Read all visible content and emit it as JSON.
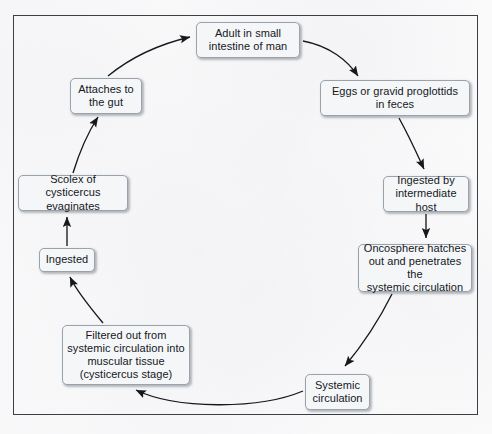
{
  "diagram": {
    "frame_border_color": "#3c3f45",
    "background_color": "#fbfbfc",
    "node_fill_color": "#f4f6f8",
    "node_border_color": "#9aa2ac",
    "arrow_color": "#16181c",
    "nodes": [
      {
        "id": "adult",
        "label": "Adult in small\nintestine of man",
        "x": 196,
        "y": 22,
        "w": 104,
        "h": 36
      },
      {
        "id": "eggs",
        "label": "Eggs or gravid proglottids\nin feces",
        "x": 320,
        "y": 80,
        "w": 150,
        "h": 36
      },
      {
        "id": "ingested_ih",
        "label": "Ingested by\nintermediate host",
        "x": 383,
        "y": 176,
        "w": 86,
        "h": 36
      },
      {
        "id": "oncosphere",
        "label": "Oncosphere hatches\nout and penetrates the\nsystemic circulation",
        "x": 358,
        "y": 244,
        "w": 114,
        "h": 48
      },
      {
        "id": "systemic",
        "label": "Systemic\ncirculation",
        "x": 305,
        "y": 374,
        "w": 65,
        "h": 36
      },
      {
        "id": "filtered",
        "label": "Filtered out from\nsystemic circulation into\nmuscular tissue\n(cysticercus stage)",
        "x": 62,
        "y": 325,
        "w": 128,
        "h": 60
      },
      {
        "id": "ingested",
        "label": "Ingested",
        "x": 39,
        "y": 248,
        "w": 56,
        "h": 24
      },
      {
        "id": "scolex",
        "label": "Scolex of cysticercus\nevaginates",
        "x": 18,
        "y": 175,
        "w": 110,
        "h": 36
      },
      {
        "id": "attaches",
        "label": "Attaches to\nthe gut",
        "x": 70,
        "y": 78,
        "w": 72,
        "h": 36
      }
    ],
    "edges": [
      {
        "from": "adult",
        "to": "eggs",
        "name": "adult-to-eggs-arrow"
      },
      {
        "from": "eggs",
        "to": "ingested_ih",
        "name": "eggs-to-ingested-host-arrow"
      },
      {
        "from": "ingested_ih",
        "to": "oncosphere",
        "name": "ingested-host-to-oncosphere-arrow"
      },
      {
        "from": "oncosphere",
        "to": "systemic",
        "name": "oncosphere-to-systemic-arrow"
      },
      {
        "from": "systemic",
        "to": "filtered",
        "name": "systemic-to-filtered-arrow"
      },
      {
        "from": "filtered",
        "to": "ingested",
        "name": "filtered-to-ingested-arrow"
      },
      {
        "from": "ingested",
        "to": "scolex",
        "name": "ingested-to-scolex-arrow"
      },
      {
        "from": "scolex",
        "to": "attaches",
        "name": "scolex-to-attaches-arrow"
      },
      {
        "from": "attaches",
        "to": "adult",
        "name": "attaches-to-adult-arrow"
      }
    ]
  }
}
